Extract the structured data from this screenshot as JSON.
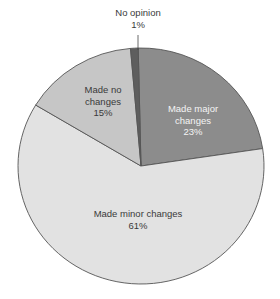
{
  "chart_data": {
    "type": "pie",
    "title": "",
    "start_angle_deg": -1.3,
    "direction": "clockwise",
    "slices": [
      {
        "label": "Made major changes",
        "value": 23,
        "value_label": "23%",
        "color": "#8c8c8c"
      },
      {
        "label": "Made minor changes",
        "value": 61,
        "value_label": "61%",
        "color": "#e2e2e2"
      },
      {
        "label": "Made no changes",
        "value": 15,
        "value_label": "15%",
        "color": "#c6c6c6"
      },
      {
        "label": "No opinion",
        "value": 1,
        "value_label": "1%",
        "color": "#5e5e5e"
      }
    ],
    "legend": "none",
    "outline_color": "#555555"
  },
  "labels": {
    "major": {
      "line1": "Made major",
      "line2": "changes",
      "pct": "23%"
    },
    "minor": {
      "line1": "Made minor changes",
      "pct": "61%"
    },
    "none": {
      "line1": "Made no",
      "line2": "changes",
      "pct": "15%"
    },
    "opinion": {
      "line1": "No opinion",
      "pct": "1%"
    }
  }
}
